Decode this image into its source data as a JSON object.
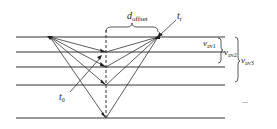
{
  "diagram": {
    "type": "seismic-layered-raypath",
    "colors": {
      "line": "#333333",
      "background": "#ffffff",
      "text": "#222222"
    },
    "layer_lines_y": [
      37,
      52,
      67,
      85,
      118
    ],
    "line_x_start": 16,
    "line_x_end": 225,
    "source": {
      "x": 50,
      "y": 37
    },
    "receiver": {
      "x": 158,
      "y": 37
    },
    "midpoint_x": 106,
    "labels": {
      "offset": {
        "main": "d",
        "sub": "offset"
      },
      "receiver_time": {
        "main": "t",
        "sub": "r"
      },
      "zero_time": {
        "main": "t",
        "sub": "0"
      },
      "v1": {
        "main": "v",
        "sub": "av1"
      },
      "v2": {
        "main": "v",
        "sub": "av2"
      },
      "v3": {
        "main": "v",
        "sub": "av3"
      },
      "continuation": "..."
    }
  }
}
